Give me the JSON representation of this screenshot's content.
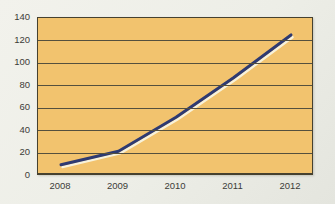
{
  "chart_data": {
    "type": "line",
    "title": "",
    "categories": [
      "2008",
      "2009",
      "2010",
      "2011",
      "2012"
    ],
    "values": [
      10,
      22,
      52,
      87,
      125
    ],
    "xlabel": "",
    "ylabel": "",
    "ylim": [
      0,
      140
    ],
    "yticks": [
      0,
      20,
      40,
      60,
      80,
      100,
      120,
      140
    ],
    "grid": "horizontal",
    "legend": "none"
  },
  "colors": {
    "page_background": "#EDEEE7",
    "plot_background": "#F2C36E",
    "gridline": "#55503E",
    "plot_border": "#46412F",
    "line": "#2E3A72",
    "line_highlight": "#F8F2DA",
    "tick_label": "#3C3C38"
  }
}
